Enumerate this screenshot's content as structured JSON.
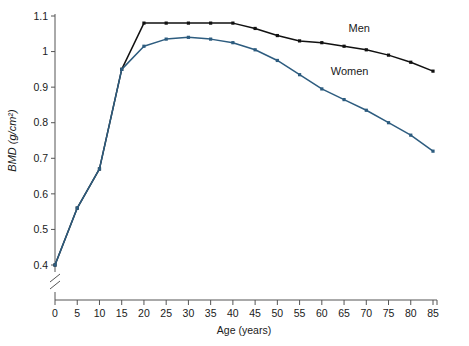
{
  "chart_data": {
    "type": "line",
    "title": "",
    "xlabel": "Age (years)",
    "ylabel": "BMD (g/cm2)",
    "ylabel_display": "BMD (g/cm²)",
    "x": [
      0,
      5,
      10,
      15,
      20,
      25,
      30,
      35,
      40,
      45,
      50,
      55,
      60,
      65,
      70,
      75,
      80,
      85
    ],
    "xticks": [
      "0",
      "5",
      "10",
      "15",
      "20",
      "25",
      "30",
      "35",
      "40",
      "45",
      "50",
      "55",
      "60",
      "65",
      "70",
      "75",
      "80",
      "85"
    ],
    "yticks": [
      "0.4",
      "0.5",
      "0.6",
      "0.7",
      "0.8",
      "0.9",
      "1",
      "1.1"
    ],
    "ytickvalues": [
      0.4,
      0.5,
      0.6,
      0.7,
      0.8,
      0.9,
      1.0,
      1.1
    ],
    "xlim": [
      0,
      85
    ],
    "ylim": [
      0.4,
      1.1
    ],
    "grid": false,
    "axis_break_y": true,
    "legend_position": "inline-labels",
    "series": [
      {
        "name": "Men",
        "color": "#111111",
        "label_x": 66,
        "label_y": 1.055,
        "values": [
          0.4,
          0.56,
          0.67,
          0.95,
          1.08,
          1.08,
          1.08,
          1.08,
          1.08,
          1.065,
          1.045,
          1.03,
          1.025,
          1.015,
          1.005,
          0.99,
          0.97,
          0.945
        ]
      },
      {
        "name": "Women",
        "color": "#2d5c7f",
        "label_x": 62,
        "label_y": 0.935,
        "values": [
          0.4,
          0.56,
          0.67,
          0.95,
          1.015,
          1.035,
          1.04,
          1.035,
          1.025,
          1.005,
          0.975,
          0.935,
          0.895,
          0.865,
          0.835,
          0.8,
          0.765,
          0.72
        ]
      }
    ]
  },
  "plot": {
    "left": 55,
    "right": 433,
    "top": 16,
    "bottom": 265,
    "axis_x_y": 300,
    "break_top": 272,
    "break_bottom": 292
  }
}
